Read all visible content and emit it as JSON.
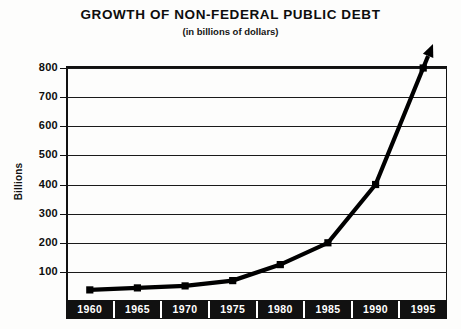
{
  "chart_data": {
    "type": "line",
    "title": "GROWTH OF NON-FEDERAL PUBLIC DEBT",
    "subtitle": "(in billions of dollars)",
    "xlabel": "",
    "ylabel": "Billions",
    "categories": [
      "1960",
      "1965",
      "1970",
      "1975",
      "1980",
      "1985",
      "1990",
      "1995"
    ],
    "x": [
      1960,
      1965,
      1970,
      1975,
      1980,
      1985,
      1990,
      1995
    ],
    "values": [
      38,
      45,
      52,
      70,
      125,
      200,
      400,
      800
    ],
    "ylim": [
      0,
      800
    ],
    "yticks": [
      100,
      200,
      300,
      400,
      500,
      600,
      700,
      800
    ],
    "ytick_labels": [
      "100",
      "200",
      "300",
      "400",
      "500",
      "600",
      "700",
      "800"
    ],
    "grid": true,
    "legend": false,
    "series": [
      {
        "name": "Non-federal public debt",
        "values": [
          38,
          45,
          52,
          70,
          125,
          200,
          400,
          800
        ],
        "color": "#000000",
        "marker": "square",
        "line_width": 4,
        "arrow_end": true
      }
    ],
    "annotations": [
      {
        "name": "growth-arrow",
        "description": "arrowhead extending upward past the 800 gridline beyond the 1995 point"
      }
    ],
    "colors": {
      "line": "#000000",
      "grid": "#1a1a1a",
      "frame": "#111111",
      "axis_band": "#111111",
      "axis_band_text": "#ffffff",
      "background": "#fdfdfc",
      "text": "#0d0d0d"
    }
  }
}
